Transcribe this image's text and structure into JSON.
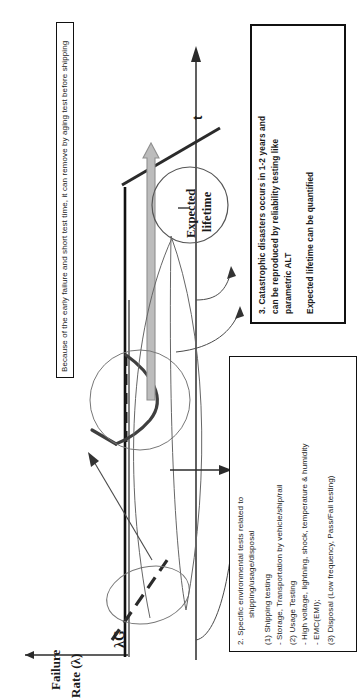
{
  "figure": {
    "kind": "bathtub-curve reliability diagram (page rotated 90 degrees)",
    "axes": {
      "y_label_line1": "Failure",
      "y_label_line2": "Rate (λ)",
      "x_label": "t",
      "baseline_label": "λG"
    },
    "callout_circle": {
      "line1": "Expected",
      "line2": "lifetime"
    },
    "note_box_top": {
      "text": "Because of the early failure and short test time, it can remove by aging test before shipping"
    },
    "box_environmental": {
      "title": "2. Specific environmental tests related to",
      "title2": "shipping/usage/disposal",
      "items": [
        "(1) Shipping testing",
        "- Storage, Transportation by vehicle/ship/rail",
        "(2) Usage Testing",
        "- High voltage, lightning, shock, temperature & humidity",
        "- EMC(EMI);",
        "(3) Disposal (Low frequency, Pass/Fail testing)"
      ]
    },
    "box_catastrophic": {
      "line1": "3. Catastrophic disasters occurs in 1-2 years and",
      "line2": "can  be  reproduced  by  reliability  testing   like",
      "line3": "parametric ALT",
      "line4": "Expected lifetime can be quantified"
    },
    "colors": {
      "ink": "#1a1a1a",
      "curve": "#3a3a3a",
      "grey_arrow_fill": "#b9b9b9",
      "grey_arrow_stroke": "#8a8a8a",
      "thin_line": "#555555"
    }
  }
}
